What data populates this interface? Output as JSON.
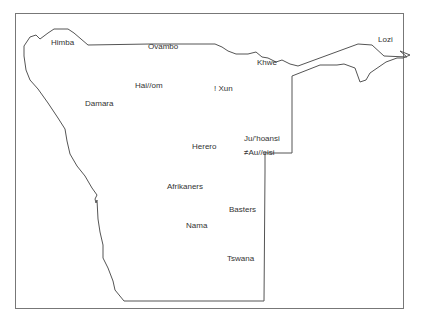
{
  "map": {
    "title": "Ethnic groups of Namibia",
    "outline_color": "#555555",
    "frame_color": "#777777",
    "labels": [
      {
        "id": "himba",
        "text": "Himba",
        "x": 51,
        "y": 38
      },
      {
        "id": "ovambo",
        "text": "Ovambo",
        "x": 148,
        "y": 42
      },
      {
        "id": "lozi",
        "text": "Lozi",
        "x": 378,
        "y": 36
      },
      {
        "id": "khwe",
        "text": "Khwe",
        "x": 257,
        "y": 58
      },
      {
        "id": "haiom",
        "text": "Hai//om",
        "x": 135,
        "y": 81
      },
      {
        "id": "xun",
        "text": "! Xun",
        "x": 214,
        "y": 84
      },
      {
        "id": "damara",
        "text": "Damara",
        "x": 85,
        "y": 99
      },
      {
        "id": "herero",
        "text": "Herero",
        "x": 192,
        "y": 142
      },
      {
        "id": "juhoansi",
        "text": "Ju/'hoansi",
        "x": 244,
        "y": 134
      },
      {
        "id": "auleisi",
        "text": "≠Au//eisi",
        "x": 244,
        "y": 148
      },
      {
        "id": "afrikaners",
        "text": "Afrikaners",
        "x": 167,
        "y": 182
      },
      {
        "id": "basters",
        "text": "Basters",
        "x": 229,
        "y": 205
      },
      {
        "id": "nama",
        "text": "Nama",
        "x": 186,
        "y": 221
      },
      {
        "id": "tswana",
        "text": "Tswana",
        "x": 227,
        "y": 254
      }
    ]
  }
}
